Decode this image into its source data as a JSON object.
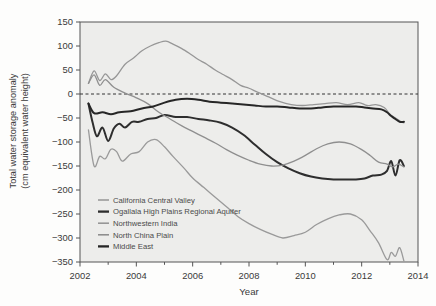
{
  "chart_data": {
    "type": "line",
    "title": "",
    "xlabel": "Year",
    "ylabel_line1": "Total water storage anomaly",
    "ylabel_line2": "(cm equivalent water height)",
    "xlim": [
      2002,
      2014
    ],
    "ylim": [
      -350,
      150
    ],
    "xticks": [
      2002,
      2004,
      2006,
      2008,
      2010,
      2012,
      2014
    ],
    "yticks": [
      150,
      100,
      50,
      0,
      -50,
      -100,
      -150,
      -200,
      -250,
      -300,
      -350
    ],
    "grid": false,
    "zero_reference_line": 0,
    "legend_position": "lower-left-inside",
    "series": [
      {
        "name": "California Central Valley",
        "color": "#9a9a9a",
        "width": 1.3,
        "x": [
          2002.3,
          2002.5,
          2002.7,
          2002.9,
          2003.1,
          2003.3,
          2003.5,
          2003.8,
          2004.1,
          2004.4,
          2004.7,
          2005.0,
          2005.3,
          2005.7,
          2006.0,
          2006.4,
          2006.8,
          2007.2,
          2007.6,
          2008.0,
          2008.4,
          2008.8,
          2009.2,
          2009.6,
          2010.0,
          2010.4,
          2010.8,
          2011.2,
          2011.6,
          2012.0,
          2012.3,
          2012.6,
          2012.9,
          2013.05,
          2013.2,
          2013.35,
          2013.5
        ],
        "y": [
          -75,
          -150,
          -130,
          -135,
          -115,
          -120,
          -140,
          -125,
          -120,
          -100,
          -95,
          -110,
          -130,
          -155,
          -175,
          -195,
          -215,
          -235,
          -255,
          -270,
          -282,
          -292,
          -300,
          -295,
          -288,
          -272,
          -260,
          -252,
          -250,
          -262,
          -285,
          -310,
          -345,
          -330,
          -338,
          -320,
          -348
        ]
      },
      {
        "name": "Ogallala High Plains Regional Aquifer",
        "color": "#2e2e2e",
        "width": 2.0,
        "x": [
          2002.3,
          2002.45,
          2002.6,
          2002.8,
          2003.0,
          2003.2,
          2003.4,
          2003.6,
          2003.85,
          2004.1,
          2004.4,
          2004.7,
          2005.0,
          2005.4,
          2005.8,
          2006.2,
          2006.6,
          2007.0,
          2007.4,
          2007.8,
          2008.2,
          2008.6,
          2009.0,
          2009.4,
          2009.8,
          2010.2,
          2010.6,
          2011.0,
          2011.4,
          2011.8,
          2012.1,
          2012.4,
          2012.7,
          2012.9,
          2013.05,
          2013.2,
          2013.35,
          2013.5
        ],
        "y": [
          -20,
          -60,
          -88,
          -70,
          -98,
          -72,
          -62,
          -70,
          -58,
          -58,
          -52,
          -50,
          -44,
          -48,
          -48,
          -52,
          -55,
          -60,
          -70,
          -85,
          -105,
          -125,
          -142,
          -155,
          -165,
          -172,
          -176,
          -178,
          -178,
          -178,
          -176,
          -170,
          -168,
          -160,
          -140,
          -170,
          -138,
          -150
        ]
      },
      {
        "name": "Northwestern India",
        "color": "#979797",
        "width": 1.3,
        "x": [
          2002.3,
          2002.5,
          2002.7,
          2002.9,
          2003.1,
          2003.3,
          2003.6,
          2003.9,
          2004.2,
          2004.5,
          2004.8,
          2005.05,
          2005.3,
          2005.6,
          2005.9,
          2006.2,
          2006.5,
          2006.8,
          2007.1,
          2007.4,
          2007.7,
          2008.0,
          2008.3,
          2008.7,
          2009.1,
          2009.5,
          2009.9,
          2010.3,
          2010.7,
          2011.1,
          2011.5,
          2011.9,
          2012.2,
          2012.5,
          2012.8,
          2013.0,
          2013.2,
          2013.4,
          2013.5
        ],
        "y": [
          22,
          48,
          28,
          42,
          30,
          38,
          62,
          75,
          90,
          100,
          107,
          110,
          104,
          95,
          84,
          72,
          62,
          50,
          40,
          30,
          18,
          12,
          4,
          -6,
          -16,
          -22,
          -24,
          -22,
          -20,
          -18,
          -22,
          -18,
          -24,
          -22,
          -28,
          -42,
          -50,
          -58,
          -60
        ]
      },
      {
        "name": "North China Plain",
        "color": "#8f8f8f",
        "width": 1.3,
        "x": [
          2002.3,
          2002.5,
          2002.7,
          2002.9,
          2003.2,
          2003.6,
          2004.0,
          2004.4,
          2004.8,
          2005.2,
          2005.6,
          2006.0,
          2006.4,
          2006.8,
          2007.2,
          2007.6,
          2008.0,
          2008.4,
          2008.8,
          2009.2,
          2009.6,
          2010.0,
          2010.4,
          2010.8,
          2011.2,
          2011.6,
          2012.0,
          2012.3,
          2012.6,
          2012.9,
          2013.1,
          2013.3,
          2013.5
        ],
        "y": [
          22,
          40,
          18,
          30,
          14,
          2,
          -8,
          -20,
          -38,
          -52,
          -66,
          -78,
          -90,
          -102,
          -116,
          -128,
          -138,
          -146,
          -150,
          -148,
          -140,
          -128,
          -114,
          -104,
          -100,
          -104,
          -116,
          -128,
          -142,
          -146,
          -152,
          -146,
          -152
        ]
      },
      {
        "name": "Middle East",
        "color": "#262626",
        "width": 2.0,
        "x": [
          2002.3,
          2002.5,
          2002.8,
          2003.1,
          2003.4,
          2003.8,
          2004.2,
          2004.6,
          2005.0,
          2005.4,
          2005.8,
          2006.2,
          2006.6,
          2007.0,
          2007.4,
          2007.8,
          2008.2,
          2008.6,
          2009.0,
          2009.4,
          2009.8,
          2010.2,
          2010.6,
          2011.0,
          2011.4,
          2011.8,
          2012.1,
          2012.4,
          2012.7,
          2012.9,
          2013.05,
          2013.2,
          2013.35,
          2013.5
        ],
        "y": [
          -20,
          -40,
          -38,
          -42,
          -38,
          -36,
          -30,
          -26,
          -18,
          -12,
          -10,
          -12,
          -16,
          -18,
          -20,
          -22,
          -24,
          -26,
          -26,
          -28,
          -30,
          -30,
          -28,
          -26,
          -26,
          -26,
          -28,
          -30,
          -32,
          -38,
          -46,
          -52,
          -58,
          -58
        ]
      }
    ]
  },
  "legend": {
    "entries": [
      "California Central Valley",
      "Ogallala High Plains Regional Aquifer",
      "Northwestern India",
      "North China Plain",
      "Middle East"
    ]
  },
  "axis": {
    "xticklabels": [
      "2002",
      "2004",
      "2006",
      "2008",
      "2010",
      "2012",
      "2014"
    ],
    "yticklabels": [
      "150",
      "100",
      "50",
      "0",
      "−50",
      "−100",
      "−150",
      "−200",
      "−250",
      "−300",
      "−350"
    ]
  }
}
